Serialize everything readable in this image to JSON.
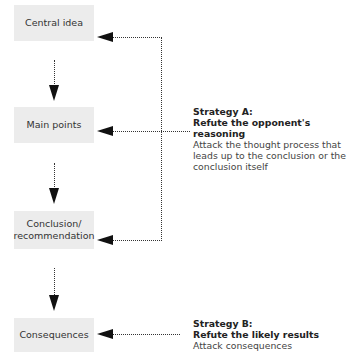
{
  "diagram": {
    "boxes": [
      {
        "id": "central-idea",
        "label": "Central idea"
      },
      {
        "id": "main-points",
        "label": "Main points"
      },
      {
        "id": "conclusion",
        "label": "Conclusion/\nrecommendation",
        "lines": [
          "Conclusion/",
          "recommendation"
        ]
      },
      {
        "id": "consequences",
        "label": "Consequences"
      }
    ],
    "strategies": [
      {
        "id": "strategy-a",
        "heading": "Strategy A:",
        "title": "Refute the opponent's reasoning",
        "description_lines": [
          "Attack the thought process that",
          "leads up to the conclusion or the",
          "conclusion itself"
        ],
        "targets": [
          "central-idea",
          "main-points",
          "conclusion"
        ]
      },
      {
        "id": "strategy-b",
        "heading": "Strategy B:",
        "title": "Refute the likely results",
        "description_lines": [
          "Attack consequences"
        ],
        "targets": [
          "consequences"
        ]
      }
    ],
    "flow": [
      {
        "from": "central-idea",
        "to": "main-points"
      },
      {
        "from": "main-points",
        "to": "conclusion"
      },
      {
        "from": "conclusion",
        "to": "consequences"
      }
    ],
    "colors": {
      "box_fill": "#ececec",
      "arrow": "#111111",
      "text": "#333333"
    }
  }
}
